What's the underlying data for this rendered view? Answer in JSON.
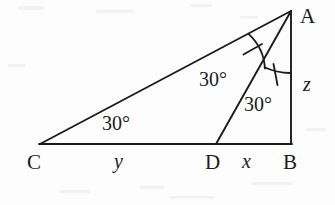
{
  "figure": {
    "kind": "geometry-diagram",
    "background_color": "#fdfdfd",
    "stroke_color": "#1b1b1b",
    "text_color": "#1b1b1b"
  },
  "vertices": {
    "a": {
      "label": "A",
      "x": 291,
      "y": 11,
      "label_x": 300,
      "label_y": 6
    },
    "b": {
      "label": "B",
      "x": 291,
      "y": 144,
      "label_x": 283,
      "label_y": 152
    },
    "c": {
      "label": "C",
      "x": 40,
      "y": 144,
      "label_x": 27,
      "label_y": 152
    },
    "d": {
      "label": "D",
      "x": 216,
      "y": 144,
      "label_x": 205,
      "label_y": 152
    }
  },
  "segments": {
    "cd": {
      "label": "y",
      "label_x": 114,
      "label_y": 151
    },
    "db": {
      "label": "x",
      "label_x": 242,
      "label_y": 151
    },
    "ab": {
      "label": "z",
      "label_x": 303,
      "label_y": 74
    }
  },
  "angles": {
    "at_c": {
      "label": "30°",
      "label_x": 102,
      "label_y": 113
    },
    "cad": {
      "label": "30°",
      "label_x": 199,
      "label_y": 69
    },
    "dab": {
      "label": "30°",
      "label_x": 244,
      "label_y": 94
    }
  },
  "marks": {
    "arc_cad": "single-tick-arc",
    "arc_dab": "single-tick-arc"
  }
}
